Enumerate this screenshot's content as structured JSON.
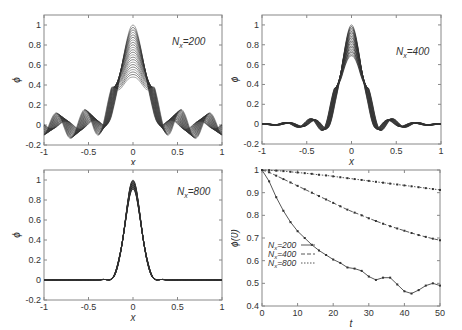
{
  "chart_data": [
    {
      "id": "panel-nx200",
      "type": "line",
      "annotation": "N_x=200",
      "annotation_main": "N",
      "annotation_sub": "x",
      "annotation_rest": "=200",
      "xlabel": "x",
      "ylabel": "ϕ",
      "xlim": [
        -1,
        1
      ],
      "ylim": [
        -0.2,
        1.1
      ],
      "xticks": [
        "-1",
        "-0.5",
        "0",
        "0.5",
        "1"
      ],
      "yticks": [
        "-0.2",
        "0",
        "0.2",
        "0.4",
        "0.6",
        "0.8",
        "1"
      ],
      "grid": false,
      "description": "Family of many overlapping profile curves; peak decays from 1.0 at center toward ~0.48 with strong oscillations in tails (amplitude up to ~±0.17)",
      "peak_range": [
        0.48,
        1.0
      ],
      "tail_amplitude": 0.17
    },
    {
      "id": "panel-nx400",
      "type": "line",
      "annotation": "N_x=400",
      "annotation_main": "N",
      "annotation_sub": "x",
      "annotation_rest": "=400",
      "xlabel": "x",
      "ylabel": "ϕ",
      "xlim": [
        -1,
        1
      ],
      "ylim": [
        -0.2,
        1.1
      ],
      "xticks": [
        "-1",
        "-0.5",
        "0",
        "0.5",
        "1"
      ],
      "yticks": [
        "-0.2",
        "0",
        "0.2",
        "0.4",
        "0.6",
        "0.8",
        "1"
      ],
      "grid": false,
      "description": "Family of overlapping curves; peak from 1.0 down to ~0.69; side minima ~-0.13 at x=±0.28, side lobes ~0.07 at x=±0.42",
      "peak_range": [
        0.69,
        1.0
      ],
      "tail_amplitude": 0.13
    },
    {
      "id": "panel-nx800",
      "type": "line",
      "annotation": "N_x=800",
      "annotation_main": "N",
      "annotation_sub": "x",
      "annotation_rest": "=800",
      "xlabel": "x",
      "ylabel": "ϕ",
      "xlim": [
        -1,
        1
      ],
      "ylim": [
        -0.2,
        1.1
      ],
      "xticks": [
        "-1",
        "-0.5",
        "0",
        "0.5",
        "1"
      ],
      "yticks": [
        "-0.2",
        "0",
        "0.2",
        "0.4",
        "0.6",
        "0.8",
        "1"
      ],
      "grid": false,
      "description": "Tightly clustered curves; peak from 1.0 down to ~0.91; small dips ~-0.02 near x=±0.2",
      "peak_range": [
        0.91,
        1.0
      ],
      "tail_amplitude": 0.02
    },
    {
      "id": "panel-peak-decay",
      "type": "line",
      "xlabel": "t",
      "ylabel": "ϕ(0)",
      "xlim": [
        0,
        50
      ],
      "ylim": [
        0.4,
        1.0
      ],
      "xticks": [
        "0",
        "10",
        "20",
        "30",
        "40",
        "50"
      ],
      "yticks": [
        "0.4",
        "0.5",
        "0.6",
        "0.7",
        "0.8",
        "0.9",
        "1"
      ],
      "grid": false,
      "legend_position": "lower-left",
      "x": [
        0,
        2,
        4,
        6,
        8,
        10,
        12,
        14,
        16,
        18,
        20,
        22,
        24,
        26,
        28,
        30,
        32,
        34,
        36,
        38,
        40,
        42,
        44,
        46,
        48,
        50
      ],
      "series": [
        {
          "name": "N_x=200",
          "legend_main": "N",
          "legend_sub": "x",
          "legend_rest": "=200",
          "style": "solid",
          "values": [
            1.0,
            0.95,
            0.88,
            0.82,
            0.77,
            0.73,
            0.7,
            0.67,
            0.645,
            0.625,
            0.605,
            0.59,
            0.57,
            0.565,
            0.555,
            0.53,
            0.515,
            0.525,
            0.525,
            0.495,
            0.465,
            0.455,
            0.47,
            0.49,
            0.5,
            0.49
          ]
        },
        {
          "name": "N_x=400",
          "legend_main": "N",
          "legend_sub": "x",
          "legend_rest": "=400",
          "style": "dashed",
          "values": [
            1.0,
            0.99,
            0.975,
            0.96,
            0.945,
            0.93,
            0.915,
            0.9,
            0.885,
            0.87,
            0.855,
            0.84,
            0.825,
            0.812,
            0.8,
            0.787,
            0.775,
            0.763,
            0.752,
            0.742,
            0.732,
            0.722,
            0.713,
            0.705,
            0.697,
            0.69
          ]
        },
        {
          "name": "N_x=800",
          "legend_main": "N",
          "legend_sub": "x",
          "legend_rest": "=800",
          "style": "dash-dot",
          "values": [
            1.0,
            0.999,
            0.997,
            0.995,
            0.992,
            0.989,
            0.986,
            0.983,
            0.979,
            0.976,
            0.972,
            0.968,
            0.964,
            0.96,
            0.956,
            0.952,
            0.948,
            0.944,
            0.94,
            0.936,
            0.932,
            0.928,
            0.924,
            0.92,
            0.916,
            0.912
          ]
        }
      ]
    }
  ]
}
